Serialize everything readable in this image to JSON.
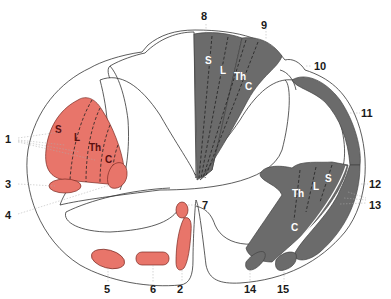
{
  "diagram": {
    "colors": {
      "descending_motor": "#e8756a",
      "ascending_sensory": "#6b6b6b",
      "outline": "#333333",
      "background": "#ffffff"
    },
    "segment_labels": {
      "sacral": "S",
      "lumbar": "L",
      "thoracic": "Th",
      "cervical": "C"
    },
    "numbers": {
      "n1": "1",
      "n2": "2",
      "n3": "3",
      "n4": "4",
      "n5": "5",
      "n6": "6",
      "n7": "7",
      "n8": "8",
      "n9": "9",
      "n10": "10",
      "n11": "11",
      "n12": "12",
      "n13": "13",
      "n14": "14",
      "n15": "15"
    }
  }
}
